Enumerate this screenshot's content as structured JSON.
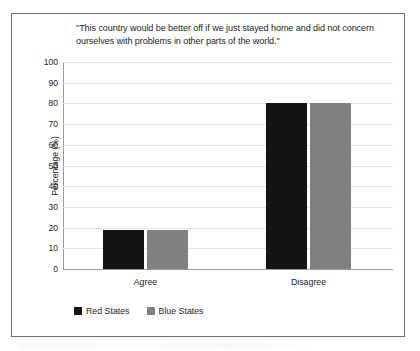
{
  "chart_data": {
    "type": "bar",
    "title": "\"This country would be better off if we just stayed home and did not concern ourselves with problems in other parts of the world.\"",
    "categories": [
      "Agree",
      "Disagree"
    ],
    "series": [
      {
        "name": "Red States",
        "color": "#141414",
        "values": [
          19,
          80
        ]
      },
      {
        "name": "Blue States",
        "color": "#808080",
        "values": [
          19,
          80
        ]
      }
    ],
    "xlabel": "",
    "ylabel": "Percentage (%)",
    "ylim": [
      0,
      100
    ],
    "ytick_step": 10,
    "yticks": [
      "100",
      "90",
      "80",
      "70",
      "60",
      "50",
      "40",
      "30",
      "20",
      "10",
      "0"
    ],
    "grid": true,
    "legend_position": "bottom-left"
  },
  "figure": {
    "border_color": "#6f6f6f",
    "background": "#ffffff",
    "gridline_color": "#e4e4e4",
    "axis_color": "#9a9a9a"
  }
}
